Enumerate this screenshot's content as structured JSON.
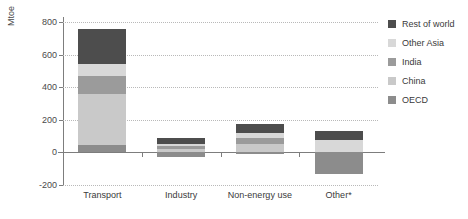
{
  "chart_data": {
    "type": "bar",
    "stacked": true,
    "title": "",
    "subtitle": "",
    "xlabel": "",
    "ylabel": "Mtoe",
    "ylim": [
      -200,
      800
    ],
    "yticks": [
      -200,
      0,
      200,
      400,
      600,
      800
    ],
    "ytick_labels": [
      "-200",
      "0",
      "200",
      "400",
      "600",
      "800"
    ],
    "grid": true,
    "legend_position": "right",
    "categories": [
      "Transport",
      "Industry",
      "Non-energy use",
      "Other*"
    ],
    "series": [
      {
        "name": "OECD",
        "color": "#8c8c8c",
        "values": [
          45,
          -28,
          -8,
          -130
        ]
      },
      {
        "name": "China",
        "color": "#c9c9c9",
        "values": [
          315,
          22,
          52,
          0
        ]
      },
      {
        "name": "India",
        "color": "#9b9b9b",
        "values": [
          110,
          18,
          38,
          0
        ]
      },
      {
        "name": "Other Asia",
        "color": "#d8d8d8",
        "values": [
          75,
          12,
          30,
          75
        ]
      },
      {
        "name": "Rest of world",
        "color": "#4d4d4d",
        "values": [
          215,
          38,
          55,
          55
        ]
      }
    ],
    "legend_entries": [
      {
        "label": "Rest of world",
        "color": "#4d4d4d"
      },
      {
        "label": "Other Asia",
        "color": "#d8d8d8"
      },
      {
        "label": "India",
        "color": "#9b9b9b"
      },
      {
        "label": "China",
        "color": "#c9c9c9"
      },
      {
        "label": "OECD",
        "color": "#8c8c8c"
      }
    ],
    "colors": {
      "axis": "#7d7d7d",
      "grid": "#b9b9b9",
      "text": "#3a3a3a",
      "background": "#ffffff"
    }
  }
}
